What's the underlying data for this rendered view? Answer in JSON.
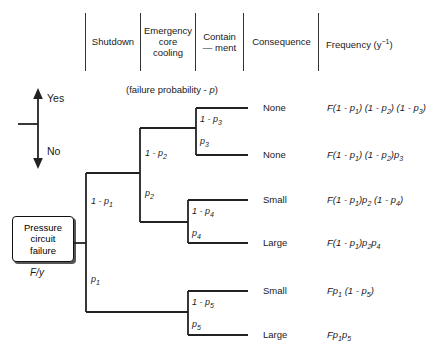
{
  "headers": [
    {
      "id": "shutdown",
      "label": "Shutdown"
    },
    {
      "id": "emergency-core-cooling",
      "line1": "Emergency",
      "line2": "core",
      "line3": "cooling"
    },
    {
      "id": "containment",
      "line1": "Contain",
      "line2": "— ment"
    },
    {
      "id": "consequence",
      "label": "Consequence"
    },
    {
      "id": "frequency",
      "label": "Frequency (y",
      "sup": "−1",
      "tail": ")"
    }
  ],
  "caption": {
    "failure_probability_pre": "(failure probability - ",
    "failure_probability_sym": "p",
    "failure_probability_post": ")"
  },
  "legend": {
    "yes": "Yes",
    "no": "No"
  },
  "root": {
    "line1": "Pressure",
    "line2": "circuit",
    "line3": "failure",
    "rate": "F/y"
  },
  "branch_labels": {
    "p1_top": {
      "pre": "1 - ",
      "sym": "p",
      "sub": "1"
    },
    "p1_bot": {
      "pre": "",
      "sym": "p",
      "sub": "1"
    },
    "p2_top": {
      "pre": "1 - ",
      "sym": "p",
      "sub": "2"
    },
    "p2_bot": {
      "pre": "",
      "sym": "p",
      "sub": "2"
    },
    "p3_top": {
      "pre": "1 - ",
      "sym": "p",
      "sub": "3"
    },
    "p3_bot": {
      "pre": "",
      "sym": "p",
      "sub": "3"
    },
    "p4_top": {
      "pre": "1 - ",
      "sym": "p",
      "sub": "4"
    },
    "p4_bot": {
      "pre": "",
      "sym": "p",
      "sub": "4"
    },
    "p5_top": {
      "pre": "1 - ",
      "sym": "p",
      "sub": "5"
    },
    "p5_bot": {
      "pre": "",
      "sym": "p",
      "sub": "5"
    }
  },
  "outcomes": [
    {
      "id": "row-1",
      "consequence": "None",
      "frequency_parts": [
        {
          "t": "F(1 - ",
          "k": "i"
        },
        {
          "t": "p",
          "k": "i"
        },
        {
          "t": "1",
          "k": "s"
        },
        {
          "t": ") (1 - ",
          "k": "i"
        },
        {
          "t": "p",
          "k": "i"
        },
        {
          "t": "2",
          "k": "s"
        },
        {
          "t": ") (1 - ",
          "k": "i"
        },
        {
          "t": "p",
          "k": "i"
        },
        {
          "t": "3",
          "k": "s"
        },
        {
          "t": ")",
          "k": "i"
        }
      ]
    },
    {
      "id": "row-2",
      "consequence": "None",
      "frequency_parts": [
        {
          "t": "F(1 - ",
          "k": "i"
        },
        {
          "t": "p",
          "k": "i"
        },
        {
          "t": "1",
          "k": "s"
        },
        {
          "t": ") (1 - ",
          "k": "i"
        },
        {
          "t": "p",
          "k": "i"
        },
        {
          "t": "2",
          "k": "s"
        },
        {
          "t": ")",
          "k": "i"
        },
        {
          "t": "p",
          "k": "i"
        },
        {
          "t": "3",
          "k": "s"
        }
      ]
    },
    {
      "id": "row-3",
      "consequence": "Small",
      "frequency_parts": [
        {
          "t": "F(1 - ",
          "k": "i"
        },
        {
          "t": "p",
          "k": "i"
        },
        {
          "t": "1",
          "k": "s"
        },
        {
          "t": ")",
          "k": "i"
        },
        {
          "t": "p",
          "k": "i"
        },
        {
          "t": "2",
          "k": "s"
        },
        {
          "t": " (1 - ",
          "k": "i"
        },
        {
          "t": "p",
          "k": "i"
        },
        {
          "t": "4",
          "k": "s"
        },
        {
          "t": ")",
          "k": "i"
        }
      ]
    },
    {
      "id": "row-4",
      "consequence": "Large",
      "frequency_parts": [
        {
          "t": "F(1 - ",
          "k": "i"
        },
        {
          "t": "p",
          "k": "i"
        },
        {
          "t": "1",
          "k": "s"
        },
        {
          "t": ")",
          "k": "i"
        },
        {
          "t": "p",
          "k": "i"
        },
        {
          "t": "2",
          "k": "s"
        },
        {
          "t": "",
          "k": "i"
        },
        {
          "t": "p",
          "k": "i"
        },
        {
          "t": "4",
          "k": "s"
        }
      ]
    },
    {
      "id": "row-5",
      "consequence": "Small",
      "frequency_parts": [
        {
          "t": "F",
          "k": "i"
        },
        {
          "t": "p",
          "k": "i"
        },
        {
          "t": "1",
          "k": "s"
        },
        {
          "t": " (1 - ",
          "k": "i"
        },
        {
          "t": "p",
          "k": "i"
        },
        {
          "t": "5",
          "k": "s"
        },
        {
          "t": ")",
          "k": "i"
        }
      ]
    },
    {
      "id": "row-6",
      "consequence": "Large",
      "frequency_parts": [
        {
          "t": "F",
          "k": "i"
        },
        {
          "t": "p",
          "k": "i"
        },
        {
          "t": "1",
          "k": "s"
        },
        {
          "t": "",
          "k": "i"
        },
        {
          "t": "p",
          "k": "i"
        },
        {
          "t": "5",
          "k": "s"
        }
      ]
    }
  ],
  "colors": {
    "line": "#222222",
    "text": "#1a1a1a",
    "divider": "#333333"
  }
}
